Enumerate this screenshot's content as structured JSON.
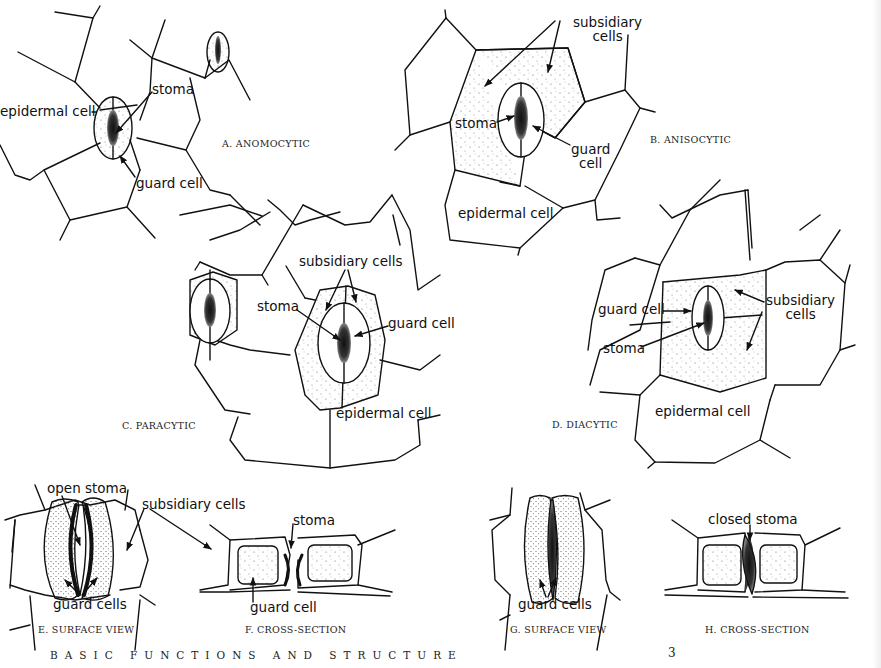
{
  "page": {
    "footer_title": "BASIC FUNCTIONS AND STRUCTURE",
    "page_number": "3"
  },
  "panels": {
    "A": {
      "caption": "A. ANOMOCYTIC",
      "labels": {
        "stoma": "stoma",
        "epidermal_cell": "epidermal cell",
        "guard_cell": "guard cell"
      }
    },
    "B": {
      "caption": "B. ANISOCYTIC",
      "labels": {
        "subsidiary_1": "subsidiary",
        "subsidiary_2": "cells",
        "stoma": "stoma",
        "guard_1": "guard",
        "guard_2": "cell",
        "epidermal_cell": "epidermal cell"
      }
    },
    "C": {
      "caption": "C. PARACYTIC",
      "labels": {
        "subsidiary_cells": "subsidiary cells",
        "stoma": "stoma",
        "guard_cell": "guard cell",
        "epidermal_cell": "epidermal cell"
      }
    },
    "D": {
      "caption": "D. DIACYTIC",
      "labels": {
        "guard_cell": "guard cell",
        "subsidiary_1": "subsidiary",
        "subsidiary_2": "cells",
        "stoma": "stoma",
        "epidermal_cell": "epidermal cell"
      }
    },
    "E": {
      "caption": "E. SURFACE VIEW",
      "labels": {
        "open_stoma": "open stoma",
        "guard_cells": "guard cells",
        "subsidiary_cells": "subsidiary cells"
      }
    },
    "F": {
      "caption": "F. CROSS-SECTION",
      "labels": {
        "stoma": "stoma",
        "guard_cell": "guard cell"
      }
    },
    "G": {
      "caption": "G. SURFACE VIEW",
      "labels": {
        "guard_cells": "guard cells"
      }
    },
    "H": {
      "caption": "H. CROSS-SECTION",
      "labels": {
        "closed_stoma": "closed stoma"
      }
    }
  }
}
